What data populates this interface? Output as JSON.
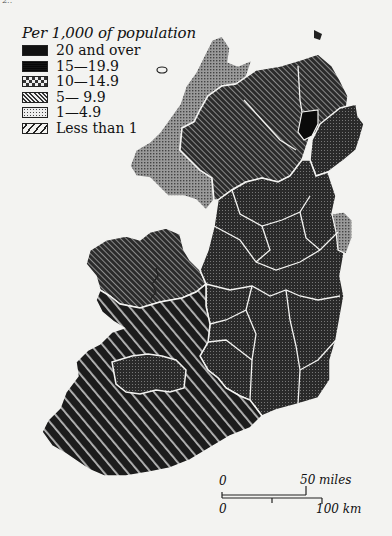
{
  "page": {
    "number": "2..",
    "background": "#f3f3f1"
  },
  "legend": {
    "title": "Per 1,000 of population",
    "items": [
      {
        "label": "20 and over",
        "pattern": "solid-black"
      },
      {
        "label": "15—19.9",
        "pattern": "dense-grid"
      },
      {
        "label": "10—14.9",
        "pattern": "checker"
      },
      {
        "label": "5— 9.9",
        "pattern": "backslash-lines"
      },
      {
        "label": "1—4.9",
        "pattern": "dots"
      },
      {
        "label": "Less than 1",
        "pattern": "slash-lines"
      }
    ]
  },
  "map": {
    "subject": "Ireland, rate per 1,000 of population by county",
    "regions": [
      {
        "name": "north-west (Donegal area)",
        "category": "1—4.9"
      },
      {
        "name": "north (Derry/Tyrone/Fermanagh area)",
        "category": "5— 9.9"
      },
      {
        "name": "north-east small area (Belfast area)",
        "category": "20 and over"
      },
      {
        "name": "east (Down area)",
        "category": "15—19.9"
      },
      {
        "name": "Louth area",
        "category": "1—4.9"
      },
      {
        "name": "west (Mayo/Galway north)",
        "category": "5— 9.9"
      },
      {
        "name": "midlands and east",
        "category": "15—19.9"
      },
      {
        "name": "south-west (Clare/Kerry/Cork)",
        "category": "Less than 1"
      },
      {
        "name": "Limerick area",
        "category": "15—19.9"
      }
    ]
  },
  "scale_bar": {
    "miles_start": "0",
    "miles_end": "50 miles",
    "km_start": "0",
    "km_end": "100 km"
  }
}
